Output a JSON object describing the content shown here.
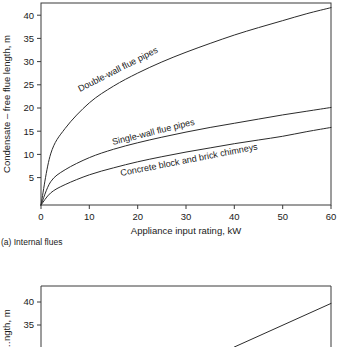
{
  "figure": {
    "caption_a": "(a) Internal flues"
  },
  "chart_data": [
    {
      "type": "line",
      "title": "",
      "panel_caption": "(a) Internal flues",
      "xlabel": "Appliance input rating, kW",
      "ylabel": "Condensate – free flue length, m",
      "xlim": [
        0,
        60
      ],
      "ylim": [
        0,
        43.5
      ],
      "xticks": [
        0,
        10,
        20,
        30,
        40,
        50,
        60
      ],
      "yticks": [
        5,
        10,
        15,
        20,
        25,
        30,
        35,
        40
      ],
      "xticklabels": [
        "0",
        "10",
        "20",
        "30",
        "40",
        "50",
        "60"
      ],
      "yticklabels": [
        "5",
        "10",
        "15",
        "20",
        "25",
        "30",
        "35",
        "40"
      ],
      "grid": false,
      "legend": "inline-curve-labels",
      "x": [
        0,
        2,
        5,
        10,
        15,
        20,
        25,
        30,
        35,
        40,
        45,
        50,
        55,
        60
      ],
      "series": [
        {
          "name": "Double-wall flue pipes",
          "label_text": "Double-wall flue pipes",
          "values": [
            0,
            11.0,
            16.5,
            22.0,
            25.6,
            28.4,
            30.8,
            32.9,
            34.8,
            36.6,
            38.2,
            39.7,
            41.2,
            42.5
          ]
        },
        {
          "name": "Single-wall flue pipes",
          "label_text": "Single-wall flue pipes",
          "values": [
            0,
            5.0,
            7.6,
            10.2,
            12.0,
            13.4,
            14.6,
            15.7,
            16.7,
            17.6,
            18.5,
            19.4,
            20.2,
            21.0
          ]
        },
        {
          "name": "Concrete block and brick chimneys",
          "label_text": "Concrete block and brick chimneys",
          "values": [
            0,
            2.6,
            4.4,
            6.5,
            8.0,
            9.3,
            10.4,
            11.4,
            12.3,
            13.2,
            14.0,
            14.8,
            15.8,
            16.7
          ]
        }
      ]
    },
    {
      "type": "line",
      "title": "",
      "panel_caption": "",
      "xlabel": "",
      "ylabel": "…ngth, m",
      "ylim": [
        33,
        43.5
      ],
      "yticks": [
        35,
        40
      ],
      "yticklabels": [
        "35",
        "40"
      ],
      "grid": false,
      "cropped": true,
      "x": [
        40,
        60
      ],
      "series": [
        {
          "name": "partial-rising-line",
          "label_text": "",
          "values": [
            33.0,
            40.5
          ]
        }
      ]
    }
  ]
}
